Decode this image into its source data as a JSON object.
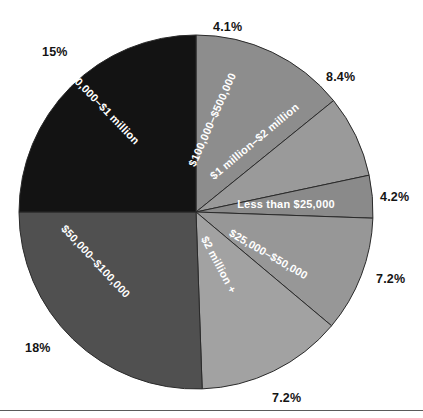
{
  "chart_data": {
    "type": "pie",
    "title": "",
    "subtitle": "",
    "xlabel": "",
    "ylabel": "",
    "legend_position": "none",
    "grid": false,
    "labels_inside_slices": true,
    "unit": "%",
    "categories": [
      "$100,000–$500,000",
      "$1 million–$2 million",
      "Less than $25,000",
      "$25,000–$50,000",
      "$2 million +",
      "$50,000–$100,000",
      "$500,000–$1 million"
    ],
    "values": [
      4.1,
      8.4,
      4.2,
      7.2,
      7.2,
      18,
      15
    ],
    "value_labels": [
      "4.1%",
      "8.4%",
      "4.2%",
      "7.2%",
      "7.2%",
      "18%",
      "15%"
    ],
    "slices": [
      {
        "name": "$100,000–$500,000",
        "value": 4.1,
        "value_label": "4.1%",
        "color": "#8d8d8d",
        "label_color": "#ffffff",
        "start_angle": 0,
        "end_angle": 51,
        "label_rotation": -66,
        "label_x": 213,
        "label_y": 120,
        "pct_x": 213,
        "pct_y": 20
      },
      {
        "name": "$1 million–$2 million",
        "value": 8.4,
        "value_label": "8.4%",
        "color": "#9a9a9a",
        "label_color": "#ffffff",
        "start_angle": 51,
        "end_angle": 78,
        "label_rotation": -40,
        "label_x": 255,
        "label_y": 142,
        "pct_x": 326,
        "pct_y": 70
      },
      {
        "name": "Less than $25,000",
        "value": 4.2,
        "value_label": "4.2%",
        "color": "#8a8a8a",
        "label_color": "#ffffff",
        "start_angle": 78,
        "end_angle": 92,
        "label_rotation": 0,
        "label_x": 286,
        "label_y": 205,
        "pct_x": 380,
        "pct_y": 190
      },
      {
        "name": "$25,000–$50,000",
        "value": 7.2,
        "value_label": "7.2%",
        "color": "#979797",
        "label_color": "#ffffff",
        "start_angle": 92,
        "end_angle": 130,
        "label_rotation": 30,
        "label_x": 268,
        "label_y": 255,
        "pct_x": 376,
        "pct_y": 272
      },
      {
        "name": "$2 million +",
        "value": 7.2,
        "value_label": "7.2%",
        "color": "#a2a2a2",
        "label_color": "#ffffff",
        "start_angle": 130,
        "end_angle": 178,
        "label_rotation": 62,
        "label_x": 218,
        "label_y": 265,
        "pct_x": 272,
        "pct_y": 391
      },
      {
        "name": "$50,000–$100,000",
        "value": 18,
        "value_label": "18%",
        "color": "#505050",
        "label_color": "#ffffff",
        "start_angle": 178,
        "end_angle": 270,
        "label_rotation": 47,
        "label_x": 95,
        "label_y": 262,
        "pct_x": 25,
        "pct_y": 341
      },
      {
        "name": "$500,000–$1 million",
        "value": 15,
        "value_label": "15%",
        "color": "#131313",
        "label_color": "#ffffff",
        "start_angle": 270,
        "end_angle": 360,
        "label_rotation": 46,
        "label_x": 100,
        "label_y": 105,
        "pct_x": 42,
        "pct_y": 45
      }
    ],
    "geometry": {
      "cx": 196,
      "cy": 212,
      "r": 177,
      "stroke": "#2a2a2a",
      "stroke_width": 1
    },
    "baseline_rule": {
      "y": 410,
      "color": "#5a5a5a"
    }
  }
}
